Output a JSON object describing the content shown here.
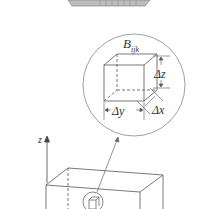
{
  "diagram": {
    "type": "box-partition-subbox",
    "labels": {
      "subbox": "B",
      "subbox_sub": "ijk",
      "dz": "Δz",
      "dy": "Δy",
      "dx": "Δx",
      "z_axis": "z"
    },
    "colors": {
      "line": "#555555",
      "top_strip": "#b5b5b5"
    }
  }
}
